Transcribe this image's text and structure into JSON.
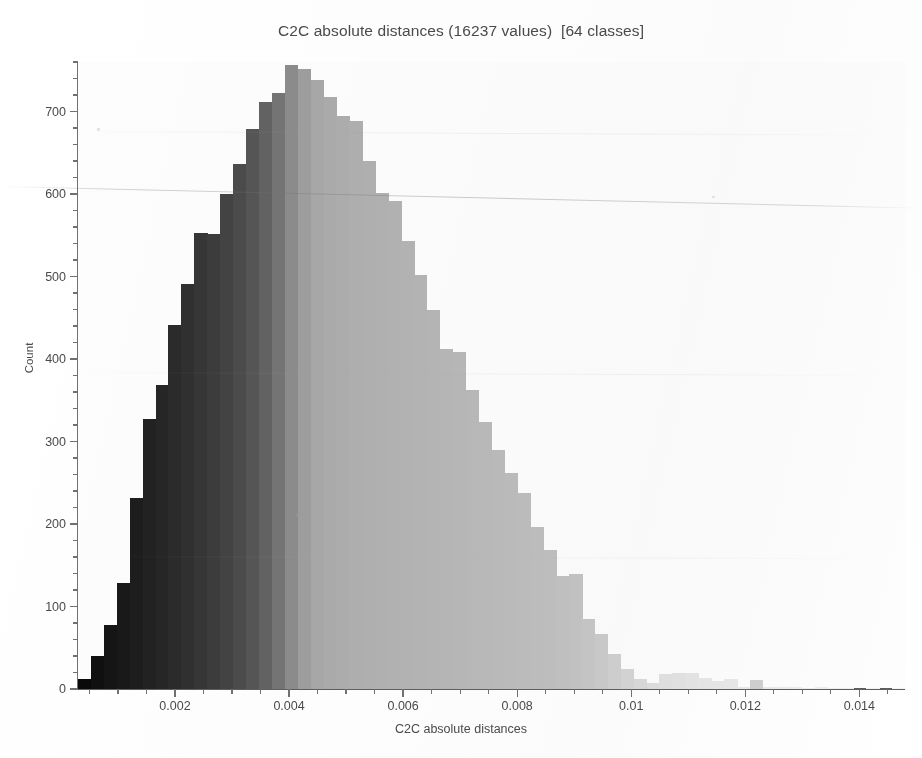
{
  "chart_data": {
    "type": "bar",
    "title": "C2C absolute distances (16237 values)  [64 classes]",
    "subtitle": "",
    "xlabel": "C2C absolute distances",
    "ylabel": "Count",
    "total_values": 16237,
    "n_classes": 64,
    "xlim": [
      0.0003,
      0.0148
    ],
    "ylim": [
      0,
      760
    ],
    "grid": false,
    "legend": null,
    "colormap": "grayscale (dark = low distance, light = high distance)",
    "x_ticks": [
      {
        "value": 0.002,
        "label": "0.002"
      },
      {
        "value": 0.004,
        "label": "0.004"
      },
      {
        "value": 0.006,
        "label": "0.006"
      },
      {
        "value": 0.008,
        "label": "0.008"
      },
      {
        "value": 0.01,
        "label": "0.01"
      },
      {
        "value": 0.012,
        "label": "0.012"
      },
      {
        "value": 0.014,
        "label": "0.014"
      }
    ],
    "y_ticks": [
      {
        "value": 0,
        "label": "0"
      },
      {
        "value": 100,
        "label": "100"
      },
      {
        "value": 200,
        "label": "200"
      },
      {
        "value": 300,
        "label": "300"
      },
      {
        "value": 400,
        "label": "400"
      },
      {
        "value": 500,
        "label": "500"
      },
      {
        "value": 600,
        "label": "600"
      },
      {
        "value": 700,
        "label": "700"
      }
    ],
    "y_minor_step": 20,
    "x_minor_step": 0.0005,
    "bin_width": 0.000227,
    "bin_centers": [
      0.000414,
      0.000641,
      0.000868,
      0.001095,
      0.001322,
      0.001549,
      0.001776,
      0.002003,
      0.00223,
      0.002457,
      0.002684,
      0.002911,
      0.003138,
      0.003365,
      0.003592,
      0.003819,
      0.004046,
      0.004273,
      0.0045,
      0.004727,
      0.004954,
      0.005181,
      0.005408,
      0.005635,
      0.005862,
      0.006089,
      0.006316,
      0.006543,
      0.00677,
      0.006997,
      0.007224,
      0.007451,
      0.007678,
      0.007905,
      0.008132,
      0.008359,
      0.008586,
      0.008813,
      0.00904,
      0.009267,
      0.009494,
      0.009721,
      0.009948,
      0.010175,
      0.010402,
      0.010629,
      0.010856,
      0.011083,
      0.01131,
      0.011537,
      0.011764,
      0.011991,
      0.012218,
      0.012445,
      0.012672,
      0.012899,
      0.013126,
      0.013353,
      0.01358,
      0.013807,
      0.014034,
      0.014261,
      0.014488,
      0.014715
    ],
    "values": [
      12,
      40,
      78,
      128,
      232,
      327,
      368,
      441,
      491,
      553,
      551,
      600,
      636,
      679,
      712,
      723,
      756,
      752,
      738,
      717,
      694,
      688,
      640,
      601,
      591,
      543,
      502,
      460,
      412,
      408,
      363,
      324,
      290,
      262,
      238,
      196,
      169,
      137,
      139,
      85,
      67,
      43,
      24,
      12,
      7,
      18,
      19,
      20,
      13,
      10,
      12,
      3,
      11,
      3,
      2,
      2,
      1,
      2,
      1,
      1,
      0,
      1,
      0,
      1
    ],
    "bar_colors": [
      "#0a0a0a",
      "#101010",
      "#151515",
      "#191919",
      "#1d1d1d",
      "#222222",
      "#262626",
      "#2b2b2b",
      "#303030",
      "#363636",
      "#3c3c3c",
      "#434343",
      "#4b4b4b",
      "#555555",
      "#636363",
      "#757575",
      "#8c8c8c",
      "#9e9e9e",
      "#a8a8a8",
      "#acacac",
      "#aeaeae",
      "#b0b0b0",
      "#b1b1b1",
      "#b2b2b2",
      "#b3b3b3",
      "#b4b4b4",
      "#b5b5b5",
      "#b6b6b6",
      "#b7b7b7",
      "#b8b8b8",
      "#b9b9b9",
      "#bababa",
      "#bbbbbb",
      "#bcbcbc",
      "#bdbdbd",
      "#bebebe",
      "#bfbfbf",
      "#c1c1c1",
      "#c3c3c3",
      "#c6c6c6",
      "#cacaca",
      "#cfcfcf",
      "#d4d4d4",
      "#d9d9d9",
      "#dddddd",
      "#e0e0e0",
      "#e2e2e2",
      "#e4e4e4",
      "#e6e6e6",
      "#e7e7e7",
      "#e8e8e8",
      "#e9e9e9",
      "#d0d0d0",
      "#ebebeb",
      "#ececec",
      "#ededed",
      "#eeeeee",
      "#efefef",
      "#f0f0f0",
      "#f1f1f1",
      "#f2f2f2",
      "#f3f3f3",
      "#f4f4f4",
      "#f5f5f5"
    ]
  }
}
